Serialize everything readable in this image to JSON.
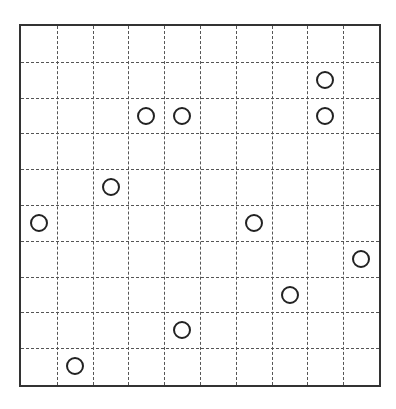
{
  "board": {
    "rows": 10,
    "cols": 10,
    "line_color": "#555555",
    "border_color": "#333333",
    "circle_color": "#222222"
  },
  "circles": [
    {
      "col": 8,
      "row": 1
    },
    {
      "col": 3,
      "row": 2
    },
    {
      "col": 4,
      "row": 2
    },
    {
      "col": 8,
      "row": 2
    },
    {
      "col": 2,
      "row": 4
    },
    {
      "col": 0,
      "row": 5
    },
    {
      "col": 6,
      "row": 5
    },
    {
      "col": 9,
      "row": 6
    },
    {
      "col": 7,
      "row": 7
    },
    {
      "col": 4,
      "row": 8
    },
    {
      "col": 1,
      "row": 9
    }
  ]
}
